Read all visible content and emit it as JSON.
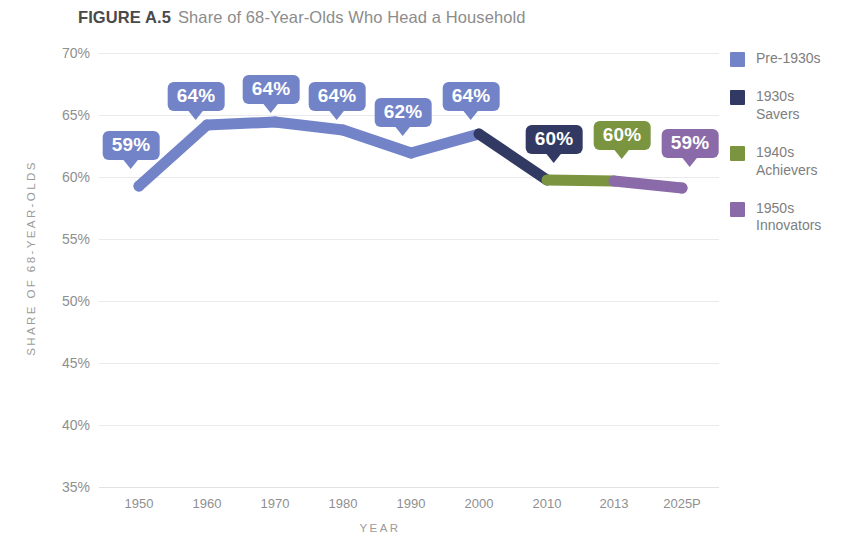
{
  "figure": {
    "number": "FIGURE A.5",
    "title": "Share of 68-Year-Olds Who Head a Household"
  },
  "chart_data": {
    "type": "line",
    "title": "Share of 68-Year-Olds Who Head a Household",
    "xlabel": "YEAR",
    "ylabel": "SHARE OF 68-YEAR-OLDS",
    "categories": [
      "1950",
      "1960",
      "1970",
      "1980",
      "1990",
      "2000",
      "2010",
      "2013",
      "2025P"
    ],
    "values": [
      59,
      64,
      64,
      64,
      62,
      64,
      60,
      60,
      59
    ],
    "point_labels": [
      "59%",
      "64%",
      "64%",
      "64%",
      "62%",
      "64%",
      "60%",
      "60%",
      "59%"
    ],
    "segment_cohorts": [
      "Pre-1930s",
      "Pre-1930s",
      "Pre-1930s",
      "Pre-1930s",
      "Pre-1930s",
      "1930s Savers",
      "1940s Achievers",
      "1950s Innovators"
    ],
    "ylim": [
      35,
      70
    ],
    "yticks": [
      "35%",
      "40%",
      "45%",
      "50%",
      "55%",
      "60%",
      "65%",
      "70%"
    ],
    "ytick_values": [
      35,
      40,
      45,
      50,
      55,
      60,
      65,
      70
    ],
    "grid": true,
    "legend_position": "right",
    "units": "percent"
  },
  "series": [
    {
      "name": "Pre-1930s",
      "color": "#7283c8",
      "label": "Pre-1930s"
    },
    {
      "name": "1930s Savers",
      "color": "#323a63",
      "label": "1930s\nSavers"
    },
    {
      "name": "1940s Achievers",
      "color": "#7a9440",
      "label": "1940s\nAchievers"
    },
    {
      "name": "1950s Innovators",
      "color": "#8a6aa8",
      "label": "1950s\nInnovators"
    }
  ],
  "points": [
    {
      "year": "1950",
      "value": 59,
      "label": "59%",
      "color": "#7283c8",
      "cx": 139,
      "cy": 186,
      "lx": 131,
      "ly": 131
    },
    {
      "year": "1960",
      "value": 64,
      "label": "64%",
      "color": "#7283c8",
      "cx": 207,
      "cy": 125,
      "lx": 196,
      "ly": 82
    },
    {
      "year": "1970",
      "value": 64,
      "label": "64%",
      "color": "#7283c8",
      "cx": 275,
      "cy": 122,
      "lx": 271,
      "ly": 75
    },
    {
      "year": "1980",
      "value": 64,
      "label": "64%",
      "color": "#7283c8",
      "cx": 343,
      "cy": 130,
      "lx": 337,
      "ly": 82
    },
    {
      "year": "1990",
      "value": 62,
      "label": "62%",
      "color": "#7283c8",
      "cx": 411,
      "cy": 153,
      "lx": 403,
      "ly": 98
    },
    {
      "year": "2000",
      "value": 64,
      "label": "64%",
      "color": "#7283c8",
      "cx": 479,
      "cy": 134,
      "lx": 471,
      "ly": 82
    },
    {
      "year": "2010",
      "value": 60,
      "label": "60%",
      "color": "#323a63",
      "cx": 547,
      "cy": 180,
      "lx": 554,
      "ly": 125
    },
    {
      "year": "2013",
      "value": 60,
      "label": "60%",
      "color": "#7a9440",
      "cx": 614,
      "cy": 181,
      "lx": 622,
      "ly": 121
    },
    {
      "year": "2025P",
      "value": 59,
      "label": "59%",
      "color": "#8a6aa8",
      "cx": 682,
      "cy": 188,
      "lx": 690,
      "ly": 129
    }
  ],
  "gridlines": [
    {
      "label": "70%",
      "y": 53
    },
    {
      "label": "65%",
      "y": 115
    },
    {
      "label": "60%",
      "y": 177
    },
    {
      "label": "55%",
      "y": 239
    },
    {
      "label": "50%",
      "y": 301
    },
    {
      "label": "45%",
      "y": 363
    },
    {
      "label": "40%",
      "y": 425
    },
    {
      "label": "35%",
      "y": 487
    }
  ],
  "xticks": [
    {
      "label": "1950",
      "x": 139
    },
    {
      "label": "1960",
      "x": 207
    },
    {
      "label": "1970",
      "x": 275
    },
    {
      "label": "1980",
      "x": 343
    },
    {
      "label": "1990",
      "x": 411
    },
    {
      "label": "2000",
      "x": 479
    },
    {
      "label": "2010",
      "x": 547
    },
    {
      "label": "2013",
      "x": 614
    },
    {
      "label": "2025P",
      "x": 682
    }
  ],
  "colors": {
    "pre_1930s": "#7283c8",
    "savers_1930s": "#323a63",
    "achievers_1940s": "#7a9440",
    "innovators_1950s": "#8a6aa8",
    "grid": "#e9e9ee",
    "text_muted": "#8f8f8f",
    "title_bold": "#4a4a4a",
    "title_regular": "#8c8c8c",
    "background": "#ffffff"
  }
}
